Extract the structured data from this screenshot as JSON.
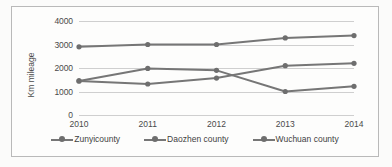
{
  "chart_data": {
    "type": "line",
    "title": "",
    "xlabel": "",
    "ylabel": "Km mileage",
    "categories": [
      "2010",
      "2011",
      "2012",
      "2013",
      "2014"
    ],
    "ylim": [
      0,
      4000
    ],
    "yticks": [
      "0",
      "1000",
      "2000",
      "3000",
      "4000"
    ],
    "grid": true,
    "legend_position": "bottom",
    "line_color": "#767676",
    "marker_color": "#6e6e6e",
    "series": [
      {
        "name": "Zunyicounty",
        "values": [
          2900,
          3000,
          3000,
          3280,
          3380
        ]
      },
      {
        "name": "Daozhen county",
        "values": [
          1450,
          1980,
          1900,
          1000,
          1220
        ]
      },
      {
        "name": "Wuchuan county",
        "values": [
          1450,
          1320,
          1570,
          2100,
          2200
        ]
      }
    ]
  },
  "axis": {
    "y_title": "Km mileage",
    "y_ticks": [
      "4000",
      "3000",
      "2000",
      "1000",
      "0"
    ],
    "x_ticks": [
      "2010",
      "2011",
      "2012",
      "2013",
      "2014"
    ]
  },
  "legend": {
    "items": [
      {
        "label": "Zunyicounty"
      },
      {
        "label": "Daozhen county"
      },
      {
        "label": "Wuchuan county"
      }
    ]
  }
}
